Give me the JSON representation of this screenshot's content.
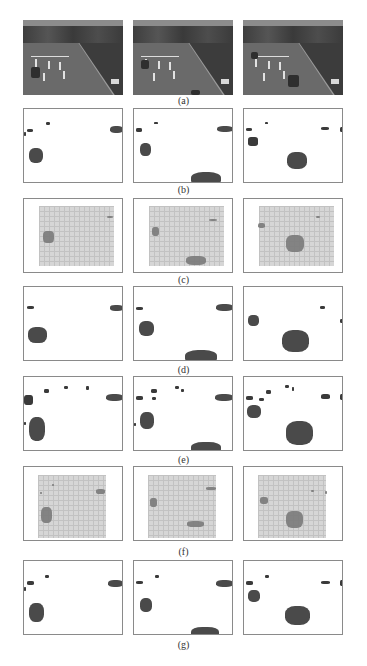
{
  "figure": {
    "columns_x": [
      23,
      133,
      243
    ],
    "panel_size": {
      "width": 100,
      "height": 75
    },
    "rows": [
      {
        "id": "a",
        "caption": "(a)",
        "type": "photo",
        "top": 20,
        "caption_top": 96,
        "description": "Original grayscale traffic video frames",
        "panels": [
          {
            "cars": [
              {
                "x": 8,
                "y": 47,
                "w": 9,
                "h": 11
              }
            ]
          },
          {
            "cars": [
              {
                "x": 8,
                "y": 40,
                "w": 8,
                "h": 9
              },
              {
                "x": 58,
                "y": 70,
                "w": 9,
                "h": 5
              }
            ]
          },
          {
            "cars": [
              {
                "x": 8,
                "y": 32,
                "w": 7,
                "h": 7
              },
              {
                "x": 45,
                "y": 55,
                "w": 11,
                "h": 12
              }
            ]
          }
        ]
      },
      {
        "id": "b",
        "caption": "(b)",
        "type": "mask",
        "top": 108,
        "caption_top": 185,
        "description": "Ground-truth foreground masks",
        "panels": [
          {
            "blobs": [
              {
                "x": 3,
                "y": 20,
                "w": 6,
                "h": 3
              },
              {
                "x": 22,
                "y": 13,
                "w": 4,
                "h": 3
              },
              {
                "x": 86,
                "y": 17,
                "w": 13,
                "h": 7
              },
              {
                "x": 0,
                "y": 23,
                "w": 2,
                "h": 4
              },
              {
                "x": 5,
                "y": 39,
                "w": 14,
                "h": 15
              }
            ]
          },
          {
            "blobs": [
              {
                "x": 2,
                "y": 19,
                "w": 6,
                "h": 4
              },
              {
                "x": 20,
                "y": 13,
                "w": 4,
                "h": 2
              },
              {
                "x": 83,
                "y": 17,
                "w": 16,
                "h": 6
              },
              {
                "x": 6,
                "y": 34,
                "w": 11,
                "h": 13
              },
              {
                "x": 57,
                "y": 63,
                "w": 30,
                "h": 14
              }
            ]
          },
          {
            "blobs": [
              {
                "x": 2,
                "y": 19,
                "w": 6,
                "h": 3
              },
              {
                "x": 21,
                "y": 13,
                "w": 3,
                "h": 2
              },
              {
                "x": 77,
                "y": 18,
                "w": 8,
                "h": 3
              },
              {
                "x": 96,
                "y": 18,
                "w": 4,
                "h": 5
              },
              {
                "x": 4,
                "y": 28,
                "w": 10,
                "h": 9
              },
              {
                "x": 43,
                "y": 43,
                "w": 20,
                "h": 17
              }
            ]
          }
        ]
      },
      {
        "id": "c",
        "caption": "(c)",
        "type": "grid",
        "top": 198,
        "caption_top": 275,
        "description": "Grid-based foreground estimate",
        "grid": {
          "x": 15,
          "y": 7,
          "w": 75,
          "h": 60
        },
        "panels": [
          {
            "blobs": [
              {
                "x": 19,
                "y": 32,
                "w": 11,
                "h": 12
              },
              {
                "x": 83,
                "y": 17,
                "w": 6,
                "h": 2
              }
            ]
          },
          {
            "blobs": [
              {
                "x": 18,
                "y": 28,
                "w": 7,
                "h": 9
              },
              {
                "x": 52,
                "y": 57,
                "w": 20,
                "h": 9
              },
              {
                "x": 75,
                "y": 20,
                "w": 8,
                "h": 2
              }
            ]
          },
          {
            "blobs": [
              {
                "x": 14,
                "y": 24,
                "w": 7,
                "h": 5
              },
              {
                "x": 42,
                "y": 36,
                "w": 18,
                "h": 17
              },
              {
                "x": 72,
                "y": 17,
                "w": 4,
                "h": 2
              }
            ]
          }
        ]
      },
      {
        "id": "d",
        "caption": "(d)",
        "type": "mask",
        "top": 286,
        "caption_top": 365,
        "description": "Detected foreground (method d)",
        "panels": [
          {
            "blobs": [
              {
                "x": 3,
                "y": 19,
                "w": 7,
                "h": 3
              },
              {
                "x": 86,
                "y": 18,
                "w": 13,
                "h": 6
              },
              {
                "x": 4,
                "y": 40,
                "w": 19,
                "h": 16
              }
            ]
          },
          {
            "blobs": [
              {
                "x": 2,
                "y": 20,
                "w": 7,
                "h": 3
              },
              {
                "x": 82,
                "y": 17,
                "w": 17,
                "h": 7
              },
              {
                "x": 5,
                "y": 34,
                "w": 15,
                "h": 15
              },
              {
                "x": 51,
                "y": 63,
                "w": 32,
                "h": 14
              }
            ]
          },
          {
            "blobs": [
              {
                "x": 4,
                "y": 28,
                "w": 11,
                "h": 11
              },
              {
                "x": 76,
                "y": 19,
                "w": 5,
                "h": 3
              },
              {
                "x": 96,
                "y": 32,
                "w": 4,
                "h": 4
              },
              {
                "x": 38,
                "y": 43,
                "w": 27,
                "h": 22
              }
            ]
          }
        ]
      },
      {
        "id": "e",
        "caption": "(e)",
        "type": "mask",
        "top": 376,
        "caption_top": 455,
        "description": "Detected foreground (method e)",
        "panels": [
          {
            "blobs": [
              {
                "x": 0,
                "y": 18,
                "w": 9,
                "h": 10
              },
              {
                "x": 20,
                "y": 12,
                "w": 5,
                "h": 4
              },
              {
                "x": 40,
                "y": 9,
                "w": 4,
                "h": 3
              },
              {
                "x": 62,
                "y": 9,
                "w": 3,
                "h": 4
              },
              {
                "x": 82,
                "y": 17,
                "w": 17,
                "h": 7
              },
              {
                "x": 0,
                "y": 45,
                "w": 2,
                "h": 3
              },
              {
                "x": 5,
                "y": 40,
                "w": 16,
                "h": 24
              }
            ]
          },
          {
            "blobs": [
              {
                "x": 2,
                "y": 19,
                "w": 7,
                "h": 4
              },
              {
                "x": 17,
                "y": 12,
                "w": 6,
                "h": 4
              },
              {
                "x": 18,
                "y": 20,
                "w": 4,
                "h": 3
              },
              {
                "x": 41,
                "y": 9,
                "w": 4,
                "h": 3
              },
              {
                "x": 47,
                "y": 12,
                "w": 3,
                "h": 3
              },
              {
                "x": 81,
                "y": 17,
                "w": 18,
                "h": 7
              },
              {
                "x": 0,
                "y": 46,
                "w": 2,
                "h": 3
              },
              {
                "x": 6,
                "y": 35,
                "w": 14,
                "h": 17
              },
              {
                "x": 57,
                "y": 65,
                "w": 30,
                "h": 12
              }
            ]
          },
          {
            "blobs": [
              {
                "x": 2,
                "y": 19,
                "w": 7,
                "h": 4
              },
              {
                "x": 15,
                "y": 21,
                "w": 5,
                "h": 3
              },
              {
                "x": 22,
                "y": 13,
                "w": 5,
                "h": 4
              },
              {
                "x": 41,
                "y": 8,
                "w": 4,
                "h": 3
              },
              {
                "x": 48,
                "y": 10,
                "w": 2,
                "h": 4
              },
              {
                "x": 77,
                "y": 17,
                "w": 9,
                "h": 5
              },
              {
                "x": 96,
                "y": 17,
                "w": 4,
                "h": 6
              },
              {
                "x": 3,
                "y": 28,
                "w": 14,
                "h": 13
              },
              {
                "x": 42,
                "y": 44,
                "w": 27,
                "h": 24
              }
            ]
          }
        ]
      },
      {
        "id": "f",
        "caption": "(f)",
        "type": "grid",
        "top": 466,
        "caption_top": 547,
        "description": "Grid-based foreground estimate (method f)",
        "grid": {
          "x": 14,
          "y": 8,
          "w": 68,
          "h": 63
        },
        "panels": [
          {
            "blobs": [
              {
                "x": 17,
                "y": 40,
                "w": 11,
                "h": 16
              },
              {
                "x": 72,
                "y": 22,
                "w": 9,
                "h": 5
              },
              {
                "x": 16,
                "y": 25,
                "w": 2,
                "h": 2
              },
              {
                "x": 28,
                "y": 17,
                "w": 2,
                "h": 2
              }
            ]
          },
          {
            "blobs": [
              {
                "x": 16,
                "y": 31,
                "w": 7,
                "h": 9
              },
              {
                "x": 53,
                "y": 54,
                "w": 17,
                "h": 6
              },
              {
                "x": 72,
                "y": 20,
                "w": 10,
                "h": 3
              }
            ]
          },
          {
            "blobs": [
              {
                "x": 16,
                "y": 30,
                "w": 8,
                "h": 7
              },
              {
                "x": 42,
                "y": 44,
                "w": 17,
                "h": 17
              },
              {
                "x": 67,
                "y": 23,
                "w": 3,
                "h": 2
              },
              {
                "x": 81,
                "y": 24,
                "w": 2,
                "h": 3
              }
            ]
          }
        ]
      },
      {
        "id": "g",
        "caption": "(g)",
        "type": "mask",
        "top": 560,
        "caption_top": 640,
        "description": "Detected foreground (proposed method)",
        "panels": [
          {
            "blobs": [
              {
                "x": 3,
                "y": 20,
                "w": 7,
                "h": 4
              },
              {
                "x": 21,
                "y": 14,
                "w": 4,
                "h": 3
              },
              {
                "x": 84,
                "y": 19,
                "w": 15,
                "h": 7
              },
              {
                "x": 0,
                "y": 26,
                "w": 2,
                "h": 4
              },
              {
                "x": 5,
                "y": 42,
                "w": 15,
                "h": 19
              }
            ]
          },
          {
            "blobs": [
              {
                "x": 2,
                "y": 20,
                "w": 7,
                "h": 3
              },
              {
                "x": 21,
                "y": 14,
                "w": 4,
                "h": 3
              },
              {
                "x": 82,
                "y": 19,
                "w": 17,
                "h": 7
              },
              {
                "x": 6,
                "y": 37,
                "w": 12,
                "h": 14
              },
              {
                "x": 57,
                "y": 66,
                "w": 28,
                "h": 11
              }
            ]
          },
          {
            "blobs": [
              {
                "x": 2,
                "y": 20,
                "w": 7,
                "h": 4
              },
              {
                "x": 21,
                "y": 14,
                "w": 4,
                "h": 3
              },
              {
                "x": 77,
                "y": 20,
                "w": 9,
                "h": 3
              },
              {
                "x": 96,
                "y": 19,
                "w": 4,
                "h": 6
              },
              {
                "x": 4,
                "y": 29,
                "w": 12,
                "h": 12
              },
              {
                "x": 41,
                "y": 45,
                "w": 25,
                "h": 19
              }
            ]
          }
        ]
      }
    ]
  }
}
